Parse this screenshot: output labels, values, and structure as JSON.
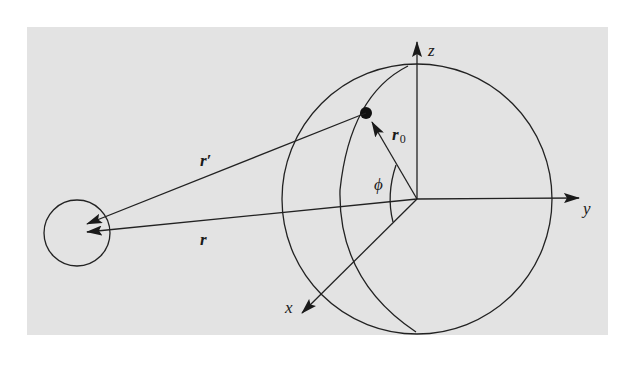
{
  "figure": {
    "background_color": "#ffffff",
    "panel_color": "#e3e3e3",
    "line_color": "#222222",
    "labels": {
      "axis_z": "z",
      "axis_y": "y",
      "axis_x": "x",
      "r_prime": "r′",
      "r": "r",
      "r0_main": "r",
      "r0_sub": "0",
      "phi": "ϕ"
    },
    "elements": [
      "large sphere with meridian",
      "small observation sphere",
      "point source on sphere",
      "coordinate axes x, y, z",
      "vector r from origin to small sphere",
      "vector r' from source point to small sphere",
      "vector r0 from origin to source point",
      "angle phi between r0 and r"
    ]
  }
}
